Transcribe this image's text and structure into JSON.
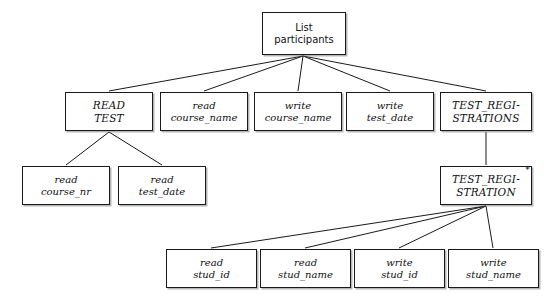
{
  "diagram": {
    "type": "tree",
    "title_text": "",
    "background_color": "#ffffff",
    "line_color": "#1a1a1a",
    "text_color": "#111111",
    "width": 544,
    "height": 301
  },
  "nodes": [
    {
      "id": "root",
      "kind": "root",
      "lines": [
        "List",
        "participants"
      ],
      "line1": "List",
      "line2": "participants",
      "x": 262,
      "y": 12,
      "w": 84,
      "h": 43,
      "marker": ""
    },
    {
      "id": "read_test",
      "kind": "entity",
      "lines": [
        "READ",
        "TEST"
      ],
      "line1": "READ",
      "line2": "TEST",
      "x": 65,
      "y": 92,
      "w": 88,
      "h": 39,
      "marker": ""
    },
    {
      "id": "read_course_name",
      "kind": "op",
      "lines": [
        "read",
        "course␣name"
      ],
      "line1": "read",
      "line2": "course_name",
      "x": 160,
      "y": 92,
      "w": 88,
      "h": 39,
      "marker": ""
    },
    {
      "id": "write_course_name",
      "kind": "op",
      "lines": [
        "write",
        "course_name"
      ],
      "line1": "write",
      "line2": "course_name",
      "x": 254,
      "y": 92,
      "w": 88,
      "h": 39,
      "marker": ""
    },
    {
      "id": "write_test_date",
      "kind": "op",
      "lines": [
        "write",
        "test_date"
      ],
      "line1": "write",
      "line2": "test_date",
      "x": 346,
      "y": 92,
      "w": 88,
      "h": 39,
      "marker": ""
    },
    {
      "id": "test_registrations",
      "kind": "entity",
      "lines": [
        "TEST_REGI-",
        "STRATIONS"
      ],
      "line1": "TEST_REGI-",
      "line2": "STRATIONS",
      "x": 440,
      "y": 92,
      "w": 92,
      "h": 39,
      "marker": ""
    },
    {
      "id": "read_course_nr",
      "kind": "op",
      "lines": [
        "read",
        "course_nr"
      ],
      "line1": "read",
      "line2": "course_nr",
      "x": 22,
      "y": 166,
      "w": 88,
      "h": 39,
      "marker": ""
    },
    {
      "id": "read_test_date",
      "kind": "op",
      "lines": [
        "read",
        "test_date"
      ],
      "line1": "read",
      "line2": "test_date",
      "x": 118,
      "y": 166,
      "w": 88,
      "h": 39,
      "marker": ""
    },
    {
      "id": "test_registration",
      "kind": "entity",
      "lines": [
        "TEST_REGI-",
        "STRATION"
      ],
      "line1": "TEST_REGI-",
      "line2": "STRATION",
      "x": 440,
      "y": 166,
      "w": 92,
      "h": 39,
      "marker": "*"
    },
    {
      "id": "read_stud_id",
      "kind": "op",
      "lines": [
        "read",
        "stud_id"
      ],
      "line1": "read",
      "line2": "stud_id",
      "x": 166,
      "y": 249,
      "w": 91,
      "h": 39,
      "marker": ""
    },
    {
      "id": "read_stud_name",
      "kind": "op",
      "lines": [
        "read",
        "stud_name"
      ],
      "line1": "read",
      "line2": "stud_name",
      "x": 260,
      "y": 249,
      "w": 91,
      "h": 39,
      "marker": ""
    },
    {
      "id": "write_stud_id",
      "kind": "op",
      "lines": [
        "write",
        "stud_id"
      ],
      "line1": "write",
      "line2": "stud_id",
      "x": 354,
      "y": 249,
      "w": 91,
      "h": 39,
      "marker": ""
    },
    {
      "id": "write_stud_name",
      "kind": "op",
      "lines": [
        "write",
        "stud_name"
      ],
      "line1": "write",
      "line2": "stud_name",
      "x": 448,
      "y": 249,
      "w": 91,
      "h": 39,
      "marker": ""
    }
  ],
  "edges": [
    {
      "id": "e-root-read-test",
      "from": "root",
      "to": "read_test",
      "x1": 303,
      "y1": 56,
      "x2": 109,
      "y2": 91
    },
    {
      "id": "e-root-read-course-name",
      "from": "root",
      "to": "read_course_name",
      "x1": 303,
      "y1": 56,
      "x2": 204,
      "y2": 91
    },
    {
      "id": "e-root-write-course-name",
      "from": "root",
      "to": "write_course_name",
      "x1": 303,
      "y1": 56,
      "x2": 298,
      "y2": 91
    },
    {
      "id": "e-root-write-test-date",
      "from": "root",
      "to": "write_test_date",
      "x1": 303,
      "y1": 56,
      "x2": 390,
      "y2": 91
    },
    {
      "id": "e-root-test-registrations",
      "from": "root",
      "to": "test_registrations",
      "x1": 303,
      "y1": 56,
      "x2": 486,
      "y2": 91
    },
    {
      "id": "e-readtest-course-nr",
      "from": "read_test",
      "to": "read_course_nr",
      "x1": 109,
      "y1": 132,
      "x2": 66,
      "y2": 165
    },
    {
      "id": "e-readtest-test-date",
      "from": "read_test",
      "to": "read_test_date",
      "x1": 109,
      "y1": 132,
      "x2": 162,
      "y2": 165
    },
    {
      "id": "e-regs-reg",
      "from": "test_registrations",
      "to": "test_registration",
      "x1": 486,
      "y1": 132,
      "x2": 486,
      "y2": 165
    },
    {
      "id": "e-reg-read-stud-id",
      "from": "test_registration",
      "to": "read_stud_id",
      "x1": 486,
      "y1": 206,
      "x2": 211,
      "y2": 248
    },
    {
      "id": "e-reg-read-stud-name",
      "from": "test_registration",
      "to": "read_stud_name",
      "x1": 486,
      "y1": 206,
      "x2": 305,
      "y2": 248
    },
    {
      "id": "e-reg-write-stud-id",
      "from": "test_registration",
      "to": "write_stud_id",
      "x1": 486,
      "y1": 206,
      "x2": 399,
      "y2": 248
    },
    {
      "id": "e-reg-write-stud-name",
      "from": "test_registration",
      "to": "write_stud_name",
      "x1": 486,
      "y1": 206,
      "x2": 493,
      "y2": 248
    }
  ]
}
